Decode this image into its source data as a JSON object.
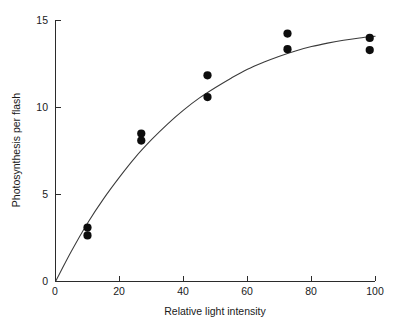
{
  "chart_data": {
    "type": "scatter",
    "title": "",
    "xlabel": "Relative light intensity",
    "ylabel": "Photosynthesis per flash",
    "xlim": [
      0,
      100
    ],
    "ylim": [
      0,
      15
    ],
    "xticks": [
      0,
      20,
      40,
      60,
      80,
      100
    ],
    "xtick_labels": [
      "0",
      "20",
      "40",
      "60",
      "80",
      "100"
    ],
    "yticks": [
      0,
      5,
      10,
      15
    ],
    "ytick_labels": [
      "0",
      "5",
      "10",
      "15"
    ],
    "grid": false,
    "legend": false,
    "series": [
      {
        "name": "Measured photosynthesis per flash",
        "marker": "filled-circle",
        "color": "#0d0d0d",
        "points": [
          {
            "x": 10,
            "y": 3.1
          },
          {
            "x": 10,
            "y": 2.65
          },
          {
            "x": 26.8,
            "y": 8.5
          },
          {
            "x": 26.8,
            "y": 8.1
          },
          {
            "x": 47.5,
            "y": 11.85
          },
          {
            "x": 47.5,
            "y": 10.6
          },
          {
            "x": 72.5,
            "y": 14.25
          },
          {
            "x": 72.5,
            "y": 13.35
          },
          {
            "x": 98.2,
            "y": 14.0
          },
          {
            "x": 98.2,
            "y": 13.3
          }
        ]
      }
    ],
    "fit_curve": {
      "name": "Saturating fit",
      "model": "rectangular hyperbola through origin",
      "color": "#3a3a3a",
      "points": [
        {
          "x": 0,
          "y": 0
        },
        {
          "x": 5,
          "y": 1.75
        },
        {
          "x": 10,
          "y": 3.35
        },
        {
          "x": 15,
          "y": 4.75
        },
        {
          "x": 20,
          "y": 6.0
        },
        {
          "x": 25,
          "y": 7.15
        },
        {
          "x": 30,
          "y": 8.15
        },
        {
          "x": 35,
          "y": 9.05
        },
        {
          "x": 40,
          "y": 9.85
        },
        {
          "x": 45,
          "y": 10.55
        },
        {
          "x": 50,
          "y": 11.15
        },
        {
          "x": 55,
          "y": 11.7
        },
        {
          "x": 60,
          "y": 12.2
        },
        {
          "x": 65,
          "y": 12.6
        },
        {
          "x": 70,
          "y": 12.95
        },
        {
          "x": 75,
          "y": 13.25
        },
        {
          "x": 80,
          "y": 13.5
        },
        {
          "x": 85,
          "y": 13.7
        },
        {
          "x": 90,
          "y": 13.87
        },
        {
          "x": 95,
          "y": 14.0
        },
        {
          "x": 100,
          "y": 14.1
        }
      ]
    }
  },
  "figure": {
    "background_color": "#ffffff",
    "marker_color": "#0d0d0d",
    "curve_color": "#3a3a3a",
    "axis_color": "#2b2b2b"
  }
}
